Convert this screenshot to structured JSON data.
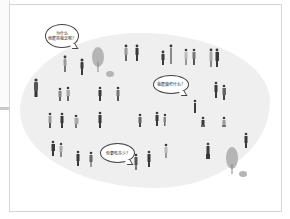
{
  "illustration": {
    "description": "Crowd of small people illustrations on a light grey blob with three speech bubbles",
    "colors": {
      "background": "#ffffff",
      "blob": "#efefef",
      "frame_border": "#d6d6d6",
      "figure_dark": "#3a3a3a",
      "figure_mid": "#8a8a8a",
      "tree": "#b0b0b0"
    },
    "speech_bubbles": [
      {
        "lines": [
          "为什么",
          "他能带我去呢？"
        ]
      },
      {
        "lines": [
          "我能做些什么？"
        ]
      },
      {
        "lines": [
          "你要吃多少？"
        ]
      }
    ]
  },
  "side_panel": {
    "visible": true
  }
}
